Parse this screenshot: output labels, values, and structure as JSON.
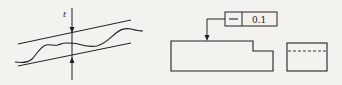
{
  "figure": {
    "type": "straightness-tolerance-illustration",
    "stroke_color": "#222222",
    "background_color": "#f3f2ee",
    "left_panel": {
      "name": "tolerance-zone-diagram",
      "tolerance_label": "t",
      "description": "Wavy actual profile lying between two parallel lines separated by tolerance t"
    },
    "right_panel": {
      "name": "drawing-callout",
      "feature_control_frame": {
        "symbol": "—",
        "symbol_name": "straightness",
        "tolerance_value": "0.1"
      },
      "front_view": "stepped rectangular part outline with leader arrow pointing to top surface",
      "side_view": "rectangle with dashed hidden line"
    }
  }
}
